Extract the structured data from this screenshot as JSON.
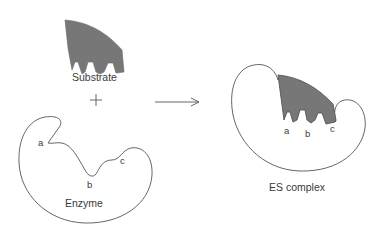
{
  "diagram": {
    "type": "enzyme-substrate binding (lock and key)",
    "colors": {
      "substrate_fill": "#777777",
      "outline": "#555555",
      "text": "#3a3a3a"
    },
    "left": {
      "substrate_label": "Substrate",
      "plus_sign": "+",
      "enzyme_label": "Enzyme",
      "site_labels": [
        "a",
        "b",
        "c"
      ]
    },
    "arrow": {
      "direction": "right"
    },
    "right": {
      "complex_label": "ES complex",
      "site_labels": [
        "a",
        "b",
        "c"
      ]
    }
  }
}
